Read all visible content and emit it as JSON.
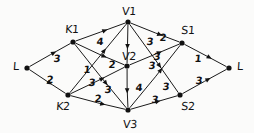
{
  "diagram": {
    "type": "directed-graph",
    "ink_color": "#1a1a1a",
    "background": "#fbfbfa",
    "nodes": [
      {
        "id": "L_src",
        "label": "L",
        "x": 27,
        "y": 68,
        "label_x": 16,
        "label_y": 66
      },
      {
        "id": "K1",
        "label": "K1",
        "x": 73,
        "y": 42,
        "label_x": 72,
        "label_y": 29
      },
      {
        "id": "K2",
        "label": "K2",
        "x": 68,
        "y": 95,
        "label_x": 63,
        "label_y": 106
      },
      {
        "id": "V1",
        "label": "V1",
        "x": 128,
        "y": 22,
        "label_x": 129,
        "label_y": 11
      },
      {
        "id": "V2",
        "label": "V2",
        "x": 127,
        "y": 66,
        "label_x": 129,
        "label_y": 56
      },
      {
        "id": "V3",
        "label": "V3",
        "x": 128,
        "y": 110,
        "label_x": 130,
        "label_y": 124
      },
      {
        "id": "S1",
        "label": "S1",
        "x": 182,
        "y": 43,
        "label_x": 188,
        "label_y": 30
      },
      {
        "id": "S2",
        "label": "S2",
        "x": 180,
        "y": 95,
        "label_x": 188,
        "label_y": 106
      },
      {
        "id": "L_snk",
        "label": "L",
        "x": 229,
        "y": 68,
        "label_x": 240,
        "label_y": 66
      }
    ],
    "edges": [
      {
        "from": "L_src",
        "to": "K1",
        "weight": "3",
        "label_x": 57,
        "label_y": 59
      },
      {
        "from": "L_src",
        "to": "K2",
        "weight": "2",
        "label_x": 50,
        "label_y": 80
      },
      {
        "from": "K1",
        "to": "V1",
        "weight": "4",
        "label_x": 100,
        "label_y": 42
      },
      {
        "from": "K1",
        "to": "V2",
        "weight": "2",
        "label_x": 112,
        "label_y": 65
      },
      {
        "from": "K1",
        "to": "V3",
        "weight": "3",
        "label_x": 108,
        "label_y": 90
      },
      {
        "from": "K2",
        "to": "V1",
        "weight": "1",
        "label_x": 87,
        "label_y": 70
      },
      {
        "from": "K2",
        "to": "V2",
        "weight": "3",
        "label_x": 92,
        "label_y": 83
      },
      {
        "from": "K2",
        "to": "V3",
        "weight": "2",
        "label_x": 98,
        "label_y": 99
      },
      {
        "from": "V1",
        "to": "V2",
        "weight": "3",
        "label_x": 150,
        "label_y": 42
      },
      {
        "from": "V1",
        "to": "S1",
        "weight": "2",
        "label_x": 163,
        "label_y": 38
      },
      {
        "from": "V1",
        "to": "S2",
        "weight": "3",
        "label_x": 152,
        "label_y": 66
      },
      {
        "from": "V2",
        "to": "V3",
        "weight": "4",
        "label_x": 139,
        "label_y": 88
      },
      {
        "from": "V2",
        "to": "S1",
        "weight": "3",
        "label_x": 157,
        "label_y": 57
      },
      {
        "from": "V3",
        "to": "S1",
        "weight": "3",
        "label_x": 166,
        "label_y": 87
      },
      {
        "from": "V3",
        "to": "S2",
        "weight": "3",
        "label_x": 155,
        "label_y": 100
      },
      {
        "from": "S1",
        "to": "L_snk",
        "weight": "1",
        "label_x": 198,
        "label_y": 59
      },
      {
        "from": "S2",
        "to": "L_snk",
        "weight": "3",
        "label_x": 199,
        "label_y": 81
      }
    ]
  }
}
